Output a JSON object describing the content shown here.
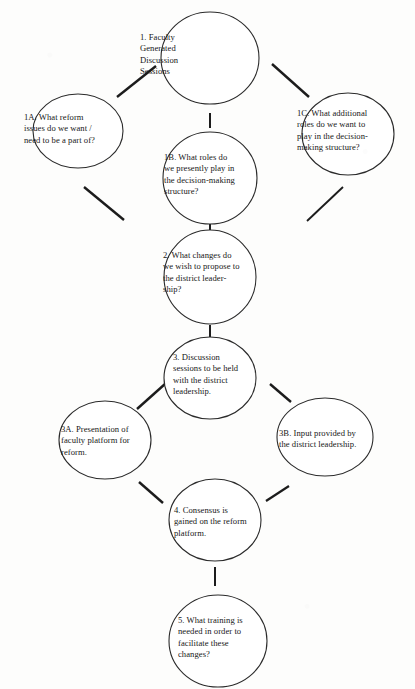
{
  "document": {
    "type": "flowchart-diagram",
    "title": "Faculty Generated Discussion Sessions process flow"
  },
  "nodes": [
    {
      "id": "1",
      "name": "node-1-faculty-generated-discussion-sessions",
      "text": "1.   Faculty\n      Generated\n      Discussion\n      Sessions",
      "cx": 210,
      "cy": 58,
      "rx": 49,
      "ry": 46,
      "text_x": 140,
      "text_y": 32,
      "text_w": 92
    },
    {
      "id": "1A",
      "name": "node-1a-what-reform-issues",
      "text": "1A. What reform\nissues do we want /\nneed to be a part of?",
      "cx": 78,
      "cy": 131,
      "rx": 45,
      "ry": 37,
      "text_x": 24,
      "text_y": 112,
      "text_w": 100
    },
    {
      "id": "1C",
      "name": "node-1c-what-additional-roles",
      "text": "1C. What additional\nroles do we want to\nplay in the decision-\nmaking structure?",
      "cx": 348,
      "cy": 134,
      "rx": 46,
      "ry": 41,
      "text_x": 297,
      "text_y": 108,
      "text_w": 104
    },
    {
      "id": "1B",
      "name": "node-1b-what-roles-do-we-presently-play",
      "text": "1B. What roles do\nwe presently play in\nthe decision-making\nstructure?",
      "cx": 210,
      "cy": 178,
      "rx": 47,
      "ry": 46,
      "text_x": 164,
      "text_y": 152,
      "text_w": 103
    },
    {
      "id": "2",
      "name": "node-2-what-changes-to-propose",
      "text": "2. What changes do\nwe wish to propose to\nthe district leader-\nship?",
      "cx": 210,
      "cy": 277,
      "rx": 46,
      "ry": 47,
      "text_x": 163,
      "text_y": 250,
      "text_w": 104
    },
    {
      "id": "3",
      "name": "node-3-discussion-sessions-with-district-leadership",
      "text": "3. Discussion\nsessions to be held\nwith the district\nleadership.",
      "cx": 210,
      "cy": 378,
      "rx": 46,
      "ry": 41,
      "text_x": 173,
      "text_y": 352,
      "text_w": 96
    },
    {
      "id": "3A",
      "name": "node-3a-presentation-of-faculty-platform",
      "text": "3A. Presentation of\nfaculty platform for\nreform.",
      "cx": 105,
      "cy": 440,
      "rx": 46,
      "ry": 39,
      "text_x": 61,
      "text_y": 424,
      "text_w": 98
    },
    {
      "id": "3B",
      "name": "node-3b-input-provided-by-district-leadership",
      "text": "3B. Input provided by\nthe district leadership.",
      "cx": 325,
      "cy": 437,
      "rx": 48,
      "ry": 39,
      "text_x": 279,
      "text_y": 428,
      "text_w": 104
    },
    {
      "id": "4",
      "name": "node-4-consensus-gained-on-reform-platform",
      "text": "4. Consensus is\ngained on the reform\nplatform.",
      "cx": 215,
      "cy": 520,
      "rx": 46,
      "ry": 41,
      "text_x": 174,
      "text_y": 505,
      "text_w": 100
    },
    {
      "id": "5",
      "name": "node-5-what-training-is-needed",
      "text": "5. What training is\nneeded in order to\nfacilitate these\nchanges?",
      "cx": 218,
      "cy": 641,
      "rx": 49,
      "ry": 46,
      "text_x": 178,
      "text_y": 615,
      "text_w": 95
    }
  ],
  "connectors": [
    {
      "name": "connector-1-to-1a",
      "from": "1",
      "to": "1A",
      "x1": 156,
      "y1": 66,
      "x2": 117,
      "y2": 97,
      "width": 2.4
    },
    {
      "name": "connector-1-to-1c",
      "from": "1",
      "to": "1C",
      "x1": 272,
      "y1": 64,
      "x2": 309,
      "y2": 97,
      "width": 2.4
    },
    {
      "name": "connector-1-to-1b",
      "from": "1",
      "to": "1B",
      "x1": 210,
      "y1": 113,
      "x2": 210,
      "y2": 128,
      "width": 2.0
    },
    {
      "name": "connector-1a-to-2",
      "from": "1A",
      "to": "2",
      "x1": 84,
      "y1": 187,
      "x2": 124,
      "y2": 220,
      "width": 2.4
    },
    {
      "name": "connector-1c-to-2",
      "from": "1C",
      "to": "2",
      "x1": 343,
      "y1": 187,
      "x2": 307,
      "y2": 221,
      "width": 1.9
    },
    {
      "name": "connector-1b-to-2",
      "from": "1B",
      "to": "2",
      "x1": 210,
      "y1": 222,
      "x2": 210,
      "y2": 233,
      "width": 2.0
    },
    {
      "name": "connector-2-to-3",
      "from": "2",
      "to": "3",
      "x1": 210,
      "y1": 325,
      "x2": 210,
      "y2": 340,
      "width": 2.0
    },
    {
      "name": "connector-3-to-3a",
      "from": "3",
      "to": "3A",
      "x1": 165,
      "y1": 384,
      "x2": 137,
      "y2": 409,
      "width": 2.4
    },
    {
      "name": "connector-3-to-3b",
      "from": "3",
      "to": "3B",
      "x1": 270,
      "y1": 384,
      "x2": 291,
      "y2": 402,
      "width": 2.4
    },
    {
      "name": "connector-3a-to-4",
      "from": "3A",
      "to": "4",
      "x1": 139,
      "y1": 482,
      "x2": 163,
      "y2": 503,
      "width": 2.4
    },
    {
      "name": "connector-4-to-3b",
      "from": "4",
      "to": "3B",
      "x1": 266,
      "y1": 501,
      "x2": 289,
      "y2": 486,
      "width": 2.2
    },
    {
      "name": "connector-4-to-5",
      "from": "4",
      "to": "5",
      "x1": 215,
      "y1": 567,
      "x2": 215,
      "y2": 586,
      "width": 2.0
    }
  ],
  "style": {
    "circle_stroke": "#2b2b2b",
    "circle_stroke_width": 1.1,
    "circle_fill": "#ffffff",
    "connector_color": "#1c1c1c",
    "text_color": "#171717",
    "page_background": "#fdfdfc"
  }
}
